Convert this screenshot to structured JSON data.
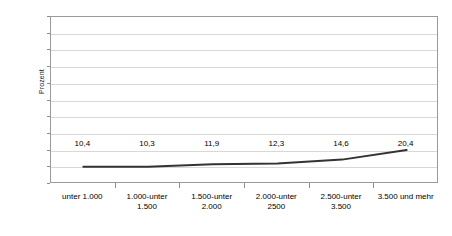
{
  "chart_data": {
    "type": "line",
    "title": "",
    "subtitle": "",
    "xlabel": "",
    "ylabel": "Prozent",
    "ylim": [
      0,
      100
    ],
    "ytick_step": 10,
    "yticks": [
      100,
      90,
      80,
      70,
      60,
      50,
      40,
      30,
      20,
      10,
      0
    ],
    "grid": true,
    "legend": "none",
    "categories": [
      "unter 1.000",
      "1.000-unter 1.500",
      "1.500-unter 2.000",
      "2.000-unter 2500",
      "2.500-unter 3.500",
      "3.500 und mehr"
    ],
    "category_lines": [
      {
        "line1": "unter 1.000",
        "line2": ""
      },
      {
        "line1": "1.000-unter",
        "line2": "1.500"
      },
      {
        "line1": "1.500-unter",
        "line2": "2.000"
      },
      {
        "line1": "2.000-unter",
        "line2": "2500"
      },
      {
        "line1": "2.500-unter",
        "line2": "3.500"
      },
      {
        "line1": "3.500 und mehr",
        "line2": ""
      }
    ],
    "values": [
      10.4,
      10.3,
      11.9,
      12.3,
      14.6,
      20.4
    ],
    "data_labels": [
      "10,4",
      "10,3",
      "11,9",
      "12,3",
      "14,6",
      "20,4"
    ],
    "series": [
      {
        "name": "Prozent",
        "values": [
          10.4,
          10.3,
          11.9,
          12.3,
          14.6,
          20.4
        ]
      }
    ],
    "colors": {
      "line": "#333333",
      "grid": "#d8d8d8",
      "frame": "#9a9a9a",
      "text": "#000000",
      "background": "#ffffff"
    }
  }
}
